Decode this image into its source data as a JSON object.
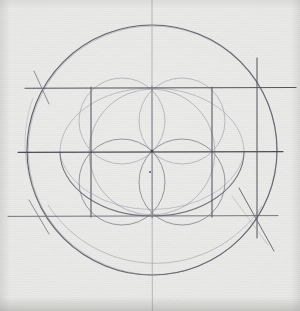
{
  "artwork": {
    "title": "Four-Petal Rosette Geometric Construction",
    "medium": "graphite pencil on textured paper",
    "caption": "",
    "paper_color": "#e9e9e7",
    "paper_edge_color": "#d6d6d3",
    "graphite_dark": "#4a4a52",
    "graphite_mid": "#6e6e78",
    "graphite_light": "#9a9aa2",
    "graphite_faint": "#b8b8bf"
  },
  "canvas": {
    "width": 300,
    "height": 311
  },
  "chart_data": {
    "type": "scatter",
    "xlabel": "",
    "ylabel": "",
    "xlim": [
      0,
      300
    ],
    "ylim": [
      0,
      311
    ],
    "grid": false,
    "legend": "none",
    "center_point": {
      "x": 152,
      "y": 151
    },
    "secondary_point": {
      "x": 150,
      "y": 172
    },
    "circles": [
      {
        "name": "outer-circle",
        "cx": 152,
        "cy": 150,
        "r": 125,
        "weight": "dark"
      },
      {
        "name": "medium-circle",
        "cx": 152,
        "cy": 152,
        "r": 63,
        "weight": "light"
      },
      {
        "name": "petal-circle-upper-left",
        "cx": 122,
        "cy": 121,
        "r": 43,
        "weight": "light"
      },
      {
        "name": "petal-circle-upper-right",
        "cx": 182,
        "cy": 121,
        "r": 43,
        "weight": "light"
      },
      {
        "name": "petal-circle-lower-left",
        "cx": 122,
        "cy": 182,
        "r": 43,
        "weight": "mid"
      },
      {
        "name": "petal-circle-lower-right",
        "cx": 182,
        "cy": 182,
        "r": 43,
        "weight": "mid"
      }
    ],
    "ellipses": [
      {
        "name": "wide-ellipse-upper",
        "cx": 152,
        "cy": 152,
        "rx": 92,
        "ry": 64,
        "weight": "light"
      },
      {
        "name": "wide-ellipse-lower",
        "cx": 152,
        "cy": 152,
        "rx": 92,
        "ry": 64,
        "weight": "mid"
      }
    ],
    "horizontal_lines": [
      {
        "name": "top-horizontal",
        "y": 88,
        "x1": 25,
        "x2": 296,
        "weight": "dark"
      },
      {
        "name": "center-horizontal",
        "y": 152,
        "x1": 18,
        "x2": 283,
        "weight": "dark"
      },
      {
        "name": "bottom-horizontal",
        "y": 216,
        "x1": 8,
        "x2": 278,
        "weight": "mid"
      }
    ],
    "vertical_lines": [
      {
        "name": "left-vertical",
        "x": 91,
        "y1": 88,
        "y2": 216,
        "weight": "dark"
      },
      {
        "name": "center-vertical",
        "x": 152,
        "y1": 0,
        "y2": 311,
        "weight": "mid"
      },
      {
        "name": "inner-right-vertical",
        "x": 212,
        "y1": 88,
        "y2": 216,
        "weight": "dark"
      },
      {
        "name": "outer-right-vertical",
        "x": 257,
        "y1": 58,
        "y2": 238,
        "weight": "dark"
      }
    ],
    "diagonals": [
      {
        "name": "diagonal-upper-left",
        "x1": 35,
        "y1": 73,
        "x2": 48,
        "y2": 103
      },
      {
        "name": "diagonal-lower-left",
        "x1": 30,
        "y1": 201,
        "x2": 48,
        "y2": 232
      },
      {
        "name": "diagonal-bottom-right",
        "x1": 240,
        "y1": 190,
        "x2": 275,
        "y2": 250
      }
    ],
    "note": "Compass-and-straightedge rosette: outer circle radius 125 px centred near (152,150); an inscribed rectangle grid at y=88/152/216 and x=91/152/212; a medium circle of radius 63; four overlapping petal circles of radius 43 forming a quatrefoil; and two wide ellipses spanning the grid."
  },
  "marks": {
    "center_dot_label": "",
    "lower_dot_label": ""
  }
}
